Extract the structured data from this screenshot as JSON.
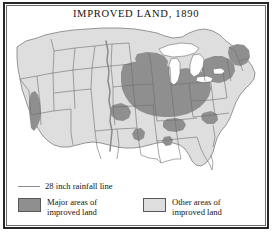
{
  "figure": {
    "title": "IMPROVED LAND, 1890",
    "frame_color": "#272727",
    "background": "#ffffff"
  },
  "map": {
    "region": "United States",
    "base_fill": "#dedede",
    "major_fill": "#8f8f8f",
    "outline_color": "#6f6f6f",
    "water_fill": "#ffffff",
    "rainfall_line_color": "#8b8b8b",
    "rainfall_line_label": "28 inch rainfall line"
  },
  "legend": {
    "rainfall": {
      "label": "28 inch rainfall line",
      "swatch": "line-swatch",
      "color": "#8b8b8b"
    },
    "major": {
      "line1": "Major areas of",
      "line2": "improved land",
      "swatch": "dark-gray-box",
      "color": "#8f8f8f"
    },
    "other": {
      "line1": "Other areas of",
      "line2": "improved land",
      "swatch": "light-gray-box",
      "color": "#dedede"
    }
  }
}
